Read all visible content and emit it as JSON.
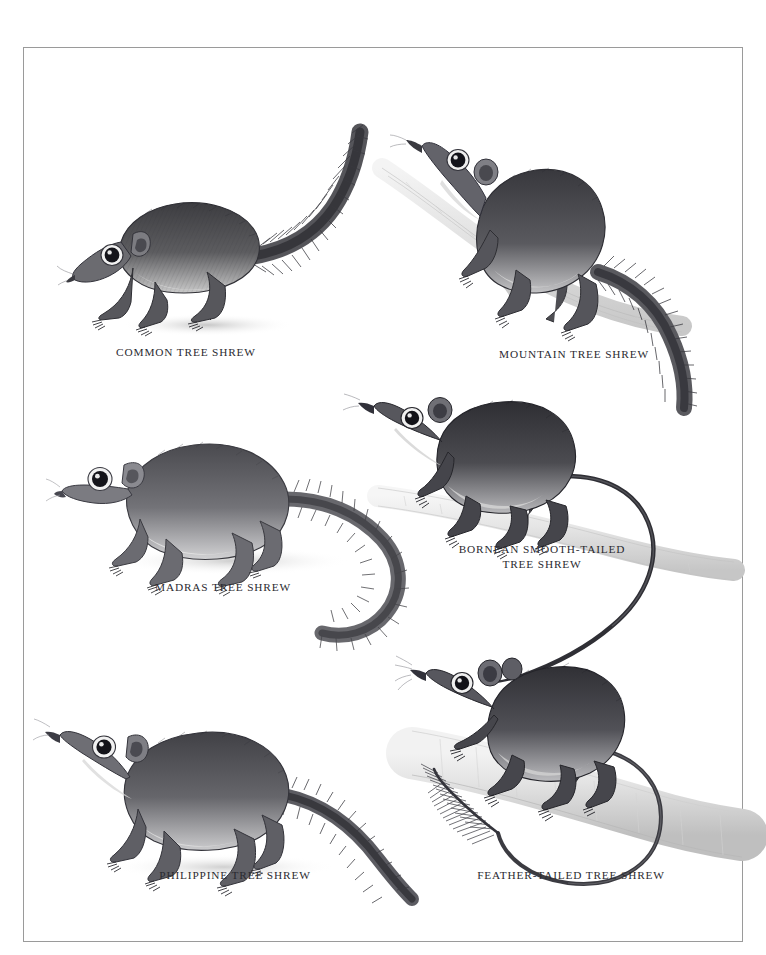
{
  "plate": {
    "background_color": "#ffffff",
    "border_color": "#9a9a9a",
    "ink_color": "#2a2a30",
    "branch_color": "#e8e8e8"
  },
  "figures": [
    {
      "id": "common-tree-shrew",
      "caption": "COMMON TREE SHREW",
      "posture": "standing on ground, long bushy tail raised and curving up to the right",
      "has_branch": false,
      "tail_type": "bushy",
      "caption_x": 162,
      "caption_y": 351
    },
    {
      "id": "mountain-tree-shrew",
      "caption": "MOUNTAIN TREE SHREW",
      "posture": "climbing a diagonal branch, head up-left, bushy tail hanging down right",
      "has_branch": true,
      "tail_type": "bushy",
      "caption_x": 588,
      "caption_y": 353
    },
    {
      "id": "madras-tree-shrew",
      "caption": "MADRAS TREE SHREW",
      "posture": "standing on ground facing left, long bushy tail sweeping down to the right",
      "has_branch": false,
      "tail_type": "bushy",
      "caption_x": 199,
      "caption_y": 586
    },
    {
      "id": "bornean-smooth-tailed-tree-shrew",
      "caption": "BORNEAN SMOOTH-TAILED\nTREE SHREW",
      "posture": "walking along a pale horizontal branch, long thin smooth tail looping down",
      "has_branch": true,
      "tail_type": "smooth",
      "caption_x": 518,
      "caption_y": 556
    },
    {
      "id": "philippine-tree-shrew",
      "caption": "PHILIPPINE TREE SHREW",
      "posture": "standing on ground facing left, tail extending down to the right",
      "has_branch": false,
      "tail_type": "bushy",
      "caption_x": 211,
      "caption_y": 874
    },
    {
      "id": "feather-tailed-tree-shrew",
      "caption": "FEATHER-TAILED TREE SHREW",
      "posture": "clinging to a thick pale branch, naked tail looping round with a feathery plume at the tip",
      "has_branch": true,
      "tail_type": "feather",
      "caption_x": 570,
      "caption_y": 874
    }
  ]
}
